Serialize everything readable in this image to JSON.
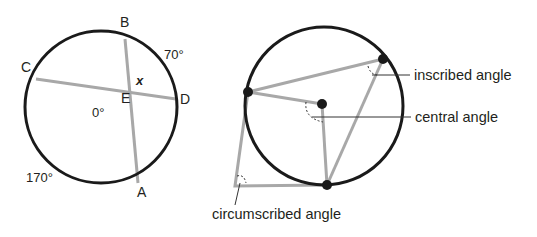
{
  "left_figure": {
    "points": {
      "A": "A",
      "B": "B",
      "C": "C",
      "D": "D",
      "E": "E"
    },
    "labels": {
      "x": "x",
      "arc_BD": "70°",
      "arc_interior": "0°",
      "arc_CA": "170°"
    }
  },
  "right_figure": {
    "annotations": {
      "inscribed": "inscribed angle",
      "central": "central angle",
      "circumscribed": "circumscribed angle"
    }
  },
  "colors": {
    "circle": "#1a1a1a",
    "chord": "#a8a8a8",
    "text": "#231f20"
  }
}
